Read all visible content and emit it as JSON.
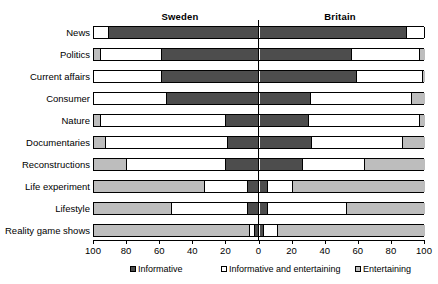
{
  "chart_data": {
    "type": "bar",
    "subtype": "diverging-stacked-bar",
    "title": "",
    "xlabel": "",
    "ylabel": "",
    "xlim": [
      -100,
      100
    ],
    "grid": false,
    "legend_position": "bottom",
    "panels": [
      "Sweden",
      "Britain"
    ],
    "categories": [
      "News",
      "Politics",
      "Current affairs",
      "Consumer",
      "Nature",
      "Documentaries",
      "Reconstructions",
      "Life experiment",
      "Lifestyle",
      "Reality game shows"
    ],
    "legend_entries": [
      "Informative",
      "Informative and entertaining",
      "Entertaining"
    ],
    "xticks": [
      100,
      80,
      60,
      40,
      20,
      0,
      20,
      40,
      60,
      80,
      100
    ],
    "colors": {
      "informative": "#4d4d4d",
      "mixed": "#ffffff",
      "entertaining": "#bdbdbd",
      "outline": "#000000"
    },
    "series": [
      {
        "name": "Sweden",
        "side": "left",
        "order_from_axis": [
          "informative",
          "mixed",
          "entertaining"
        ],
        "values": {
          "informative": [
            91,
            59,
            59,
            56,
            20,
            19,
            20,
            7,
            7,
            3
          ],
          "mixed": [
            9,
            37,
            41,
            44,
            76,
            74,
            60,
            26,
            46,
            3
          ],
          "entertaining": [
            0,
            4,
            0,
            0,
            4,
            7,
            20,
            67,
            47,
            94
          ]
        }
      },
      {
        "name": "Britain",
        "side": "right",
        "order_from_axis": [
          "informative",
          "mixed",
          "entertaining"
        ],
        "values": {
          "informative": [
            89,
            56,
            59,
            31,
            30,
            32,
            26,
            5,
            5,
            3
          ],
          "mixed": [
            11,
            41,
            40,
            61,
            67,
            55,
            38,
            15,
            48,
            8
          ],
          "entertaining": [
            0,
            3,
            1,
            8,
            3,
            13,
            36,
            80,
            47,
            89
          ]
        }
      }
    ]
  }
}
